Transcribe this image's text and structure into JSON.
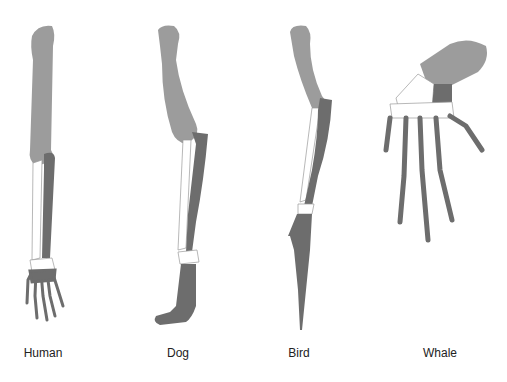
{
  "diagram": {
    "type": "homologous-forelimb-comparison",
    "legend_colors": {
      "humerus": "#9c9c9c",
      "radius_and_carpals": "#ffffff",
      "ulna_and_digits": "#6d6d6d",
      "outline": "#8a8a8a"
    },
    "limbs": [
      {
        "id": "human",
        "label": "Human",
        "label_x": 43
      },
      {
        "id": "dog",
        "label": "Dog",
        "label_x": 178
      },
      {
        "id": "bird",
        "label": "Bird",
        "label_x": 299
      },
      {
        "id": "whale",
        "label": "Whale",
        "label_x": 440
      }
    ]
  }
}
